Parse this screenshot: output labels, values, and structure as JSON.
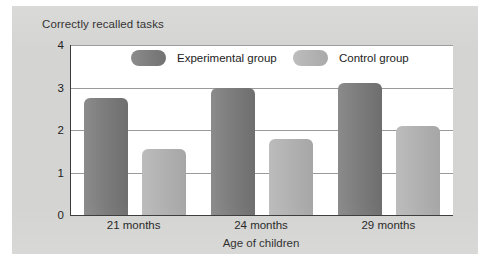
{
  "figure": {
    "title": "Correctly recalled tasks",
    "background_color": "#d4d4d2",
    "plot_background_color": "#ffffff",
    "axis_color": "#3a3a3a",
    "gridline_color": "#9a9a9a"
  },
  "chart_data": {
    "type": "bar",
    "title": "Correctly recalled tasks",
    "xlabel": "Age of children",
    "ylabel": "",
    "categories": [
      "21 months",
      "24 months",
      "29 months"
    ],
    "series": [
      {
        "name": "Experimental group",
        "color": "#7d7d7d",
        "values": [
          2.75,
          3.0,
          3.1
        ]
      },
      {
        "name": "Control group",
        "color": "#b2b2b2",
        "values": [
          1.55,
          1.8,
          2.1
        ]
      }
    ],
    "ylim": [
      0,
      4
    ],
    "yticks": [
      0,
      1,
      2,
      3,
      4
    ],
    "ytick_labels": [
      "0",
      "1",
      "2",
      "3",
      "4"
    ],
    "grid": true,
    "legend_position": "top-inside"
  },
  "legend": {
    "items": [
      {
        "label": "Experimental group",
        "swatch": "experimental"
      },
      {
        "label": "Control group",
        "swatch": "control"
      }
    ]
  }
}
